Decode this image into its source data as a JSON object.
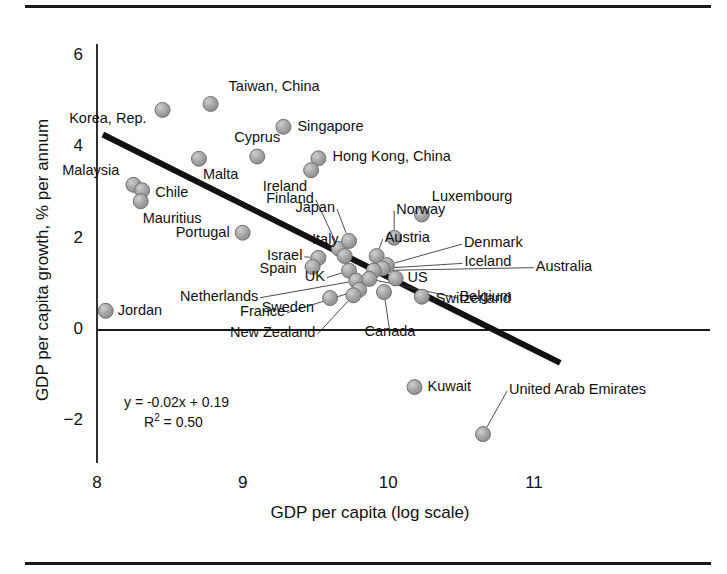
{
  "chart_data": {
    "type": "scatter",
    "title": "",
    "xlabel": "GDP per capita (log scale)",
    "ylabel": "GDP per capita growth, % per annum",
    "xlim": [
      7.78,
      11.2
    ],
    "ylim": [
      -2.6,
      6.35
    ],
    "xticks": [
      8,
      9,
      10,
      11
    ],
    "xtick_labels": [
      "8",
      "9",
      "10",
      "11"
    ],
    "yticks": [
      -2,
      0,
      2,
      4,
      6
    ],
    "ytick_labels": [
      "−2",
      "0",
      "2",
      "4",
      "6"
    ],
    "grid": false,
    "legend": false,
    "annotations": {
      "equation": "y = -0.02x + 0.19",
      "r_squared_prefix": "R",
      "r_squared_exp": "2",
      "r_squared_value": " = 0.50"
    },
    "trendline": {
      "label": "linear-fit",
      "x_start": 8.04,
      "y_start": 4.28,
      "x_end": 11.18,
      "y_end": -0.72,
      "color": "#111111",
      "width": 6
    },
    "marker": {
      "color": "#9a9a9a",
      "edge": "#6b6b6b",
      "radius": 7.5
    },
    "points": [
      {
        "name": "Taiwan, China",
        "x": 8.78,
        "y": 4.95,
        "label_dx": 18,
        "label_dy": -17,
        "anchor": "left",
        "leader": false
      },
      {
        "name": "Korea, Rep.",
        "x": 8.45,
        "y": 4.82,
        "label_dx": -16,
        "label_dy": 9,
        "anchor": "right",
        "leader": false
      },
      {
        "name": "Singapore",
        "x": 9.28,
        "y": 4.45,
        "label_dx": 14,
        "label_dy": 0,
        "anchor": "left",
        "leader": false
      },
      {
        "name": "Cyprus",
        "x": 9.1,
        "y": 3.8,
        "label_dx": 0,
        "label_dy": -18,
        "anchor": "center",
        "leader": false
      },
      {
        "name": "Hong Kong, China",
        "x": 9.52,
        "y": 3.76,
        "label_dx": 14,
        "label_dy": -1,
        "anchor": "left",
        "leader": false
      },
      {
        "name": "Malta",
        "x": 8.7,
        "y": 3.75,
        "label_dx": 4,
        "label_dy": 16,
        "anchor": "left",
        "leader": false
      },
      {
        "name": "Malaysia",
        "x": 8.25,
        "y": 3.18,
        "label_dx": -14,
        "label_dy": -14,
        "anchor": "right",
        "leader": false
      },
      {
        "name": "Ireland",
        "x": 9.47,
        "y": 3.5,
        "label_dx": -4,
        "label_dy": 17,
        "anchor": "right",
        "leader": false
      },
      {
        "name": "Chile",
        "x": 8.31,
        "y": 3.06,
        "label_dx": 13,
        "label_dy": 3,
        "anchor": "left",
        "leader": false
      },
      {
        "name": "Mauritius",
        "x": 8.3,
        "y": 2.82,
        "label_dx": 2,
        "label_dy": 18,
        "anchor": "left",
        "leader": false
      },
      {
        "name": "Luxembourg",
        "x": 10.23,
        "y": 2.53,
        "label_dx": 10,
        "label_dy": -17,
        "anchor": "left",
        "leader": false
      },
      {
        "name": "Portugal",
        "x": 9.0,
        "y": 2.13,
        "label_dx": -13,
        "label_dy": 0,
        "anchor": "right",
        "leader": false
      },
      {
        "name": "Finland",
        "x": 9.66,
        "y": 1.78,
        "label_dx": -25,
        "label_dy": -50,
        "anchor": "right",
        "leader": true
      },
      {
        "name": "Japan",
        "x": 9.73,
        "y": 1.95,
        "label_dx": -14,
        "label_dy": -33,
        "anchor": "right",
        "leader": true
      },
      {
        "name": "Norway",
        "x": 10.04,
        "y": 2.02,
        "label_dx": 2,
        "label_dy": -28,
        "anchor": "left",
        "leader": true
      },
      {
        "name": "Austria",
        "x": 9.92,
        "y": 1.62,
        "label_dx": 8,
        "label_dy": -18,
        "anchor": "left",
        "leader": true
      },
      {
        "name": "Italy",
        "x": 9.7,
        "y": 1.62,
        "label_dx": -6,
        "label_dy": -16,
        "anchor": "right",
        "leader": false
      },
      {
        "name": "Denmark",
        "x": 9.99,
        "y": 1.42,
        "label_dx": 77,
        "label_dy": -22,
        "anchor": "left",
        "leader": true
      },
      {
        "name": "Iceland",
        "x": 9.96,
        "y": 1.35,
        "label_dx": 82,
        "label_dy": -6,
        "anchor": "left",
        "leader": true
      },
      {
        "name": "Australia",
        "x": 9.9,
        "y": 1.3,
        "label_dx": 162,
        "label_dy": -4,
        "anchor": "left",
        "leader": true
      },
      {
        "name": "Israel",
        "x": 9.52,
        "y": 1.58,
        "label_dx": -16,
        "label_dy": -2,
        "anchor": "right",
        "leader": true
      },
      {
        "name": "Spain",
        "x": 9.48,
        "y": 1.38,
        "label_dx": -16,
        "label_dy": 2,
        "anchor": "right",
        "leader": false
      },
      {
        "name": "UK",
        "x": 9.73,
        "y": 1.3,
        "label_dx": -24,
        "label_dy": 6,
        "anchor": "right",
        "leader": true
      },
      {
        "name": "US",
        "x": 10.05,
        "y": 1.13,
        "label_dx": 12,
        "label_dy": 0,
        "anchor": "left",
        "leader": false
      },
      {
        "name": "Netherlands",
        "x": 9.78,
        "y": 1.08,
        "label_dx": -98,
        "label_dy": 16,
        "anchor": "right",
        "leader": true
      },
      {
        "name": "Belgium",
        "x": 9.87,
        "y": 1.12,
        "label_dx": 90,
        "label_dy": 18,
        "anchor": "left",
        "leader": true
      },
      {
        "name": "Switzerland",
        "x": 10.23,
        "y": 0.73,
        "label_dx": 14,
        "label_dy": 2,
        "anchor": "left",
        "leader": false
      },
      {
        "name": "France",
        "x": 9.8,
        "y": 0.88,
        "label_dx": -74,
        "label_dy": 22,
        "anchor": "right",
        "leader": true
      },
      {
        "name": "Sweden",
        "x": 9.6,
        "y": 0.7,
        "label_dx": -16,
        "label_dy": 10,
        "anchor": "right",
        "leader": false
      },
      {
        "name": "New Zealand",
        "x": 9.76,
        "y": 0.76,
        "label_dx": -38,
        "label_dy": 38,
        "anchor": "right",
        "leader": true
      },
      {
        "name": "Canada",
        "x": 9.97,
        "y": 0.83,
        "label_dx": 6,
        "label_dy": 40,
        "anchor": "center",
        "leader": true
      },
      {
        "name": "Jordan",
        "x": 8.06,
        "y": 0.42,
        "label_dx": 12,
        "label_dy": 0,
        "anchor": "left",
        "leader": false
      },
      {
        "name": "Kuwait",
        "x": 10.18,
        "y": -1.25,
        "label_dx": 13,
        "label_dy": 0,
        "anchor": "left",
        "leader": false
      },
      {
        "name": "United Arab Emirates",
        "x": 10.65,
        "y": -2.28,
        "label_dx": 26,
        "label_dy": -44,
        "anchor": "left",
        "leader": true
      }
    ]
  },
  "figure": {
    "top_rule": "horizontal-rule",
    "bottom_rule": "horizontal-rule"
  }
}
